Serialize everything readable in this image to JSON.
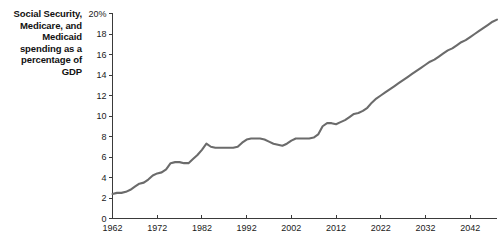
{
  "chart_data": {
    "type": "line",
    "title": "Social Security, Medicare, and Medicaid spending as a percentage of GDP",
    "title_lines": [
      "Social Security,",
      "Medicare, and",
      "Medicaid",
      "spending as a",
      "percentage of",
      "GDP"
    ],
    "xlabel": "",
    "ylabel": "",
    "xlim": [
      1962,
      2048
    ],
    "ylim": [
      0,
      20
    ],
    "grid": false,
    "legend": null,
    "line_color": "#6b6b6b",
    "axis_color": "#3a3a3a",
    "ytick_labels": [
      "0",
      "2",
      "4",
      "6",
      "8",
      "10",
      "12",
      "14",
      "16",
      "18",
      "20%"
    ],
    "ytick_values": [
      0,
      2,
      4,
      6,
      8,
      10,
      12,
      14,
      16,
      18,
      20
    ],
    "xtick_labels": [
      "1962",
      "1972",
      "1982",
      "1992",
      "2002",
      "2012",
      "2022",
      "2032",
      "2042"
    ],
    "xtick_values": [
      1962,
      1972,
      1982,
      1992,
      2002,
      2012,
      2022,
      2032,
      2042
    ],
    "x": [
      1962,
      1963,
      1964,
      1965,
      1966,
      1967,
      1968,
      1969,
      1970,
      1971,
      1972,
      1973,
      1974,
      1975,
      1976,
      1977,
      1978,
      1979,
      1980,
      1981,
      1982,
      1983,
      1984,
      1985,
      1986,
      1987,
      1988,
      1989,
      1990,
      1991,
      1992,
      1993,
      1994,
      1995,
      1996,
      1997,
      1998,
      1999,
      2000,
      2001,
      2002,
      2003,
      2004,
      2005,
      2006,
      2007,
      2008,
      2009,
      2010,
      2011,
      2012,
      2013,
      2014,
      2015,
      2016,
      2017,
      2018,
      2019,
      2020,
      2021,
      2022,
      2023,
      2024,
      2025,
      2026,
      2027,
      2028,
      2029,
      2030,
      2031,
      2032,
      2033,
      2034,
      2035,
      2036,
      2037,
      2038,
      2039,
      2040,
      2041,
      2042,
      2043,
      2044,
      2045,
      2046,
      2047,
      2048
    ],
    "values": [
      2.4,
      2.5,
      2.5,
      2.6,
      2.8,
      3.1,
      3.4,
      3.5,
      3.8,
      4.2,
      4.4,
      4.5,
      4.8,
      5.4,
      5.5,
      5.5,
      5.4,
      5.4,
      5.8,
      6.2,
      6.7,
      7.3,
      7.0,
      6.9,
      6.9,
      6.9,
      6.9,
      6.9,
      7.0,
      7.4,
      7.7,
      7.8,
      7.8,
      7.8,
      7.7,
      7.5,
      7.3,
      7.2,
      7.1,
      7.3,
      7.6,
      7.8,
      7.8,
      7.8,
      7.8,
      7.9,
      8.2,
      9.0,
      9.3,
      9.3,
      9.2,
      9.4,
      9.6,
      9.9,
      10.2,
      10.3,
      10.5,
      10.8,
      11.3,
      11.7,
      12.0,
      12.3,
      12.6,
      12.9,
      13.2,
      13.5,
      13.8,
      14.1,
      14.4,
      14.7,
      15.0,
      15.3,
      15.5,
      15.8,
      16.1,
      16.4,
      16.6,
      16.9,
      17.2,
      17.4,
      17.7,
      18.0,
      18.3,
      18.6,
      18.9,
      19.2,
      19.4
    ]
  }
}
